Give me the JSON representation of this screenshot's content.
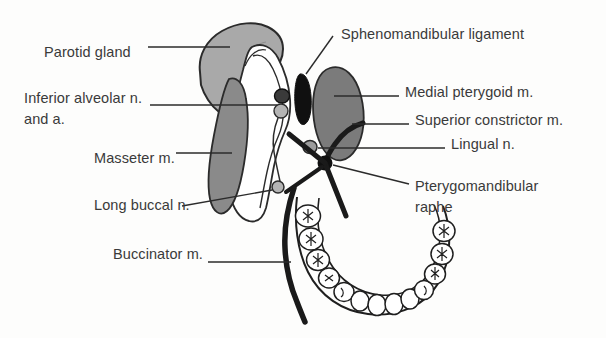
{
  "figure": {
    "background_color": "#fdfdfc",
    "text_color": "#3a3a3a",
    "line_color": "#2b2b2b"
  },
  "labels": [
    {
      "id": "parotid-gland",
      "text": "Parotid gland",
      "x": 44,
      "y": 52,
      "align": "left"
    },
    {
      "id": "inferior-alveolar",
      "text": "Inferior alveolar n.",
      "x": 24,
      "y": 98,
      "align": "left"
    },
    {
      "id": "inferior-alveolar-line2",
      "text": "and a.",
      "x": 24,
      "y": 119,
      "align": "left"
    },
    {
      "id": "masseter",
      "text": "Masseter m.",
      "x": 94,
      "y": 158,
      "align": "left"
    },
    {
      "id": "long-buccal",
      "text": "Long buccal n.",
      "x": 94,
      "y": 205,
      "align": "left"
    },
    {
      "id": "buccinator",
      "text": "Buccinator m.",
      "x": 113,
      "y": 254,
      "align": "left"
    },
    {
      "id": "sphenomandibular",
      "text": "Sphenomandibular ligament",
      "x": 341,
      "y": 34,
      "align": "left"
    },
    {
      "id": "medial-pterygoid",
      "text": "Medial pterygoid m.",
      "x": 405,
      "y": 92,
      "align": "left"
    },
    {
      "id": "superior-constrictor",
      "text": "Superior constrictor m.",
      "x": 415,
      "y": 120,
      "align": "left"
    },
    {
      "id": "lingual-nerve",
      "text": "Lingual n.",
      "x": 451,
      "y": 144,
      "align": "left"
    },
    {
      "id": "pterygomandibular",
      "text": "Pterygomandibular",
      "x": 415,
      "y": 186,
      "align": "left"
    },
    {
      "id": "pterygomandibular-line2",
      "text": "raphe",
      "x": 415,
      "y": 207,
      "align": "left"
    }
  ],
  "structures": [
    {
      "id": "parotid-gland",
      "name": "Parotid gland",
      "fill": "#a9a9a9",
      "stroke": "#2b2b2b"
    },
    {
      "id": "masseter-muscle",
      "name": "Masseter m.",
      "fill": "#8a8a8a",
      "stroke": "#2b2b2b"
    },
    {
      "id": "medial-pterygoid-muscle",
      "name": "Medial pterygoid m.",
      "fill": "#7b7b7b",
      "stroke": "#2b2b2b"
    },
    {
      "id": "mandibular-ramus",
      "name": "Mandibular ramus",
      "fill": "#ffffff",
      "stroke": "#2b2b2b"
    },
    {
      "id": "sphenomandibular-ligament",
      "name": "Sphenomandibular ligament",
      "fill": "#101010",
      "stroke": "#101010"
    },
    {
      "id": "inferior-alveolar-nerve",
      "name": "Inferior alveolar n.",
      "fill": "#3a3a3a",
      "stroke": "#101010"
    },
    {
      "id": "inferior-alveolar-artery",
      "name": "Inferior alveolar a.",
      "fill": "#b4b4b4",
      "stroke": "#2b2b2b"
    },
    {
      "id": "long-buccal-nerve",
      "name": "Long buccal n.",
      "fill": "#b4b4b4",
      "stroke": "#2b2b2b"
    },
    {
      "id": "lingual-nerve",
      "name": "Lingual n.",
      "fill": "#9c9c9c",
      "stroke": "#2b2b2b"
    },
    {
      "id": "buccinator-muscle",
      "name": "Buccinator m.",
      "fill": "none",
      "stroke": "#1a1a1a"
    },
    {
      "id": "superior-constrictor-muscle",
      "name": "Superior constrictor m.",
      "fill": "none",
      "stroke": "#1a1a1a"
    },
    {
      "id": "pterygomandibular-raphe",
      "name": "Pterygomandibular raphe",
      "fill": "#101010",
      "stroke": "#101010"
    },
    {
      "id": "mandibular-arch",
      "name": "Mandibular dental arch",
      "fill": "#ffffff",
      "stroke": "#1f1f1f"
    }
  ],
  "teeth": {
    "molar_count": 6,
    "incisor_count": 8,
    "cusp_marking": "x"
  }
}
